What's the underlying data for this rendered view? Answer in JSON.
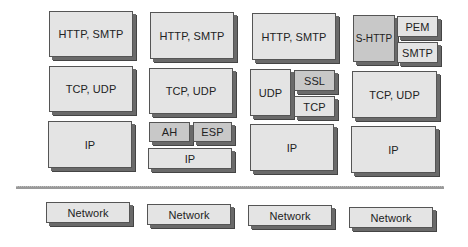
{
  "diagram": {
    "columns": [
      {
        "application": "HTTP, SMTP",
        "transport": "TCP, UDP",
        "network": "IP",
        "link": "Network"
      },
      {
        "application": "HTTP, SMTP",
        "transport": "TCP, UDP",
        "network_upper": [
          "AH",
          "ESP"
        ],
        "network": "IP",
        "link": "Network"
      },
      {
        "application": "HTTP, SMTP",
        "transport_left": "UDP",
        "transport_right_upper": "SSL",
        "transport_right_lower": "TCP",
        "network": "IP",
        "link": "Network"
      },
      {
        "application_left": "S-HTTP",
        "application_right_upper": "PEM",
        "application_right_lower": "SMTP",
        "transport": "TCP, UDP",
        "network": "IP",
        "link": "Network"
      }
    ],
    "colors": {
      "box_fill": "#e4e4e4",
      "box_fill_dark": "#c8c8c8",
      "shadow": "#6a6a6a",
      "divider": "#9a9a9a"
    }
  }
}
